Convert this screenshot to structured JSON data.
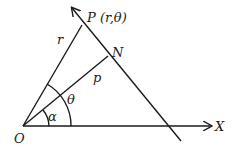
{
  "diagram": {
    "labels": {
      "point_p": "P (r,θ)",
      "point_n": "N",
      "origin": "O",
      "x_axis": "X",
      "segment_op": "r",
      "segment_on": "p",
      "angle_theta": "θ",
      "angle_alpha": "α"
    },
    "colors": {
      "stroke": "#1a1a1a",
      "background": "#ffffff"
    }
  }
}
